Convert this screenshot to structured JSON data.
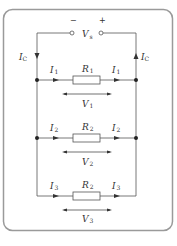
{
  "diagram": {
    "source": {
      "label": "V",
      "subscript": "s",
      "minus": "−",
      "plus": "+"
    },
    "supply_current": {
      "left": {
        "label": "I",
        "subscript": "C"
      },
      "right": {
        "label": "I",
        "subscript": "C"
      }
    },
    "branches": [
      {
        "resistor": {
          "label": "R",
          "subscript": "1"
        },
        "current_in": {
          "label": "I",
          "subscript": "1"
        },
        "current_out": {
          "label": "I",
          "subscript": "1"
        },
        "voltage": {
          "label": "V",
          "subscript": "1"
        }
      },
      {
        "resistor": {
          "label": "R",
          "subscript": "2"
        },
        "current_in": {
          "label": "I",
          "subscript": "2"
        },
        "current_out": {
          "label": "I",
          "subscript": "2"
        },
        "voltage": {
          "label": "V",
          "subscript": "2"
        }
      },
      {
        "resistor": {
          "label": "R",
          "subscript": "2"
        },
        "current_in": {
          "label": "I",
          "subscript": "3"
        },
        "current_out": {
          "label": "I",
          "subscript": "3"
        },
        "voltage": {
          "label": "V",
          "subscript": "3"
        }
      }
    ],
    "colors": {
      "wire": "#555555",
      "border": "#9a9a9a",
      "text": "#333333"
    }
  }
}
